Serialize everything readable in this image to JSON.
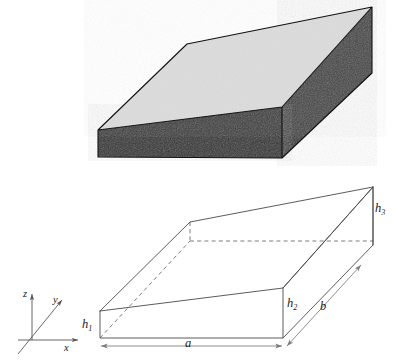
{
  "figure": {
    "panels": [
      {
        "id": "solid-block",
        "name": "shaded-solid-wedge",
        "description": "Shaded three-dimensional wedge block with light grey top face and dark front and right side faces",
        "faces": [
          {
            "name": "top-face",
            "fill": "#dcdcdc"
          },
          {
            "name": "front-face",
            "fill": "#2f2f2f"
          },
          {
            "name": "right-face",
            "fill": "#3a3a3a"
          }
        ]
      },
      {
        "id": "wireframe-block",
        "name": "labelled-wireframe-wedge",
        "description": "Line drawing of the same wedge with dimension labels"
      }
    ],
    "labels": {
      "h1": "h",
      "h1_sub": "1",
      "h2": "h",
      "h2_sub": "2",
      "h3": "h",
      "h3_sub": "3",
      "a": "a",
      "b": "b"
    },
    "axes": {
      "x": "x",
      "y": "y",
      "z": "z"
    },
    "colors": {
      "top_face": "#dcdcdc",
      "front_face": "#2f2f2f",
      "right_face": "#3a3a3a",
      "outline": "#4a4a4a",
      "dashed": "#6e6e6e",
      "dimension": "#7a7a7a",
      "background": "#ffffff",
      "text": "#1a1a1a"
    }
  }
}
